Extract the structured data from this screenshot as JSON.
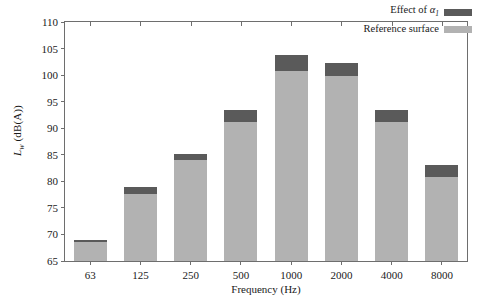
{
  "chart_data": {
    "type": "bar",
    "title": "",
    "subtitle": "",
    "xlabel": "Frequency (Hz)",
    "ylabel": "L_w (dB(A))",
    "ylabel_base": "L",
    "ylabel_sub": "w",
    "ylabel_units": " (dB(A))",
    "categories": [
      "63",
      "125",
      "250",
      "500",
      "1000",
      "2000",
      "4000",
      "8000"
    ],
    "ylim": [
      65,
      110
    ],
    "yticks": [
      65,
      70,
      75,
      80,
      85,
      90,
      95,
      100,
      105,
      110
    ],
    "ytick_labels": [
      "65",
      "70",
      "75",
      "80",
      "85",
      "90",
      "95",
      "100",
      "105",
      "110"
    ],
    "grid": false,
    "stacked": true,
    "legend_position": "top-right",
    "series": [
      {
        "name": "Reference surface",
        "color": "#b2b2b2",
        "values": [
          68.6,
          77.7,
          84.0,
          91.1,
          100.8,
          99.9,
          91.1,
          80.9
        ]
      },
      {
        "name": "Effect of alpha_1",
        "color": "#5a5a5a",
        "values": [
          68.8,
          79.0,
          85.2,
          93.4,
          103.8,
          102.3,
          93.4,
          83.1
        ]
      }
    ],
    "bar_tops": [
      68.8,
      79.0,
      85.2,
      93.4,
      103.8,
      102.3,
      93.4,
      83.1
    ],
    "reference_tops": [
      68.6,
      77.7,
      84.0,
      91.1,
      100.8,
      99.9,
      91.1,
      80.9
    ]
  },
  "legend": {
    "items": [
      {
        "label_base": "Effect of ",
        "label_symbol": "α",
        "label_sub": "1",
        "color": "#5a5a5a",
        "name": "effect-of-alpha"
      },
      {
        "label_base": "Reference surface",
        "label_symbol": "",
        "label_sub": "",
        "color": "#b2b2b2",
        "name": "reference-surface"
      }
    ]
  }
}
